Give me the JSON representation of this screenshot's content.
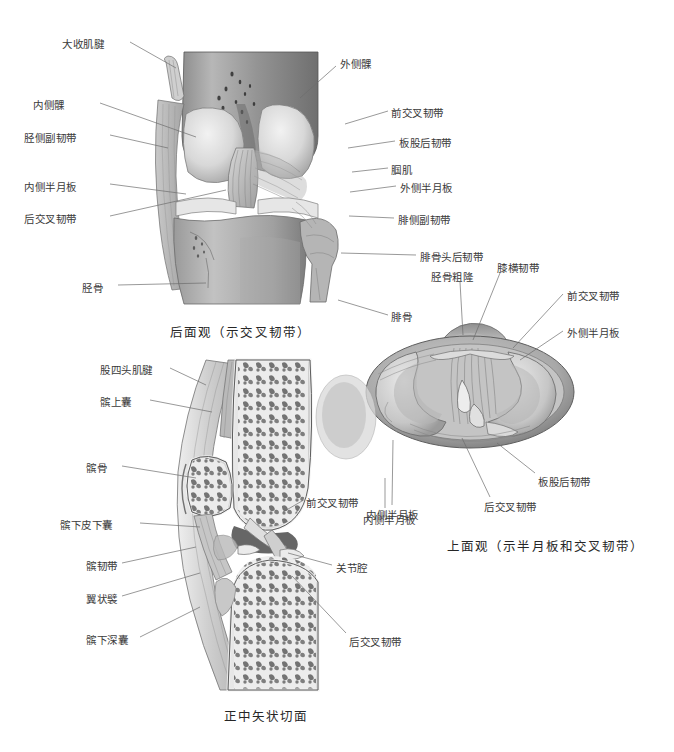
{
  "page": {
    "background": "#ffffff",
    "width": 674,
    "height": 752,
    "ink": "#3a3a3a"
  },
  "figures": [
    {
      "id": "posterior-view",
      "caption": "后面观（示交叉韧带）",
      "caption_pos": [
        170,
        322
      ],
      "labels_left": [
        {
          "text": "大收肌腱",
          "x": 62,
          "y": 38,
          "lx1": 130,
          "ly1": 42,
          "lx2": 176,
          "ly2": 68
        },
        {
          "text": "内侧髁",
          "x": 33,
          "y": 99,
          "lx1": 100,
          "ly1": 103,
          "lx2": 196,
          "ly2": 137
        },
        {
          "text": "胫侧副韧带",
          "x": 24,
          "y": 132,
          "lx1": 110,
          "ly1": 135,
          "lx2": 168,
          "ly2": 148
        },
        {
          "text": "内侧半月板",
          "x": 24,
          "y": 181,
          "lx1": 110,
          "ly1": 184,
          "lx2": 186,
          "ly2": 194
        },
        {
          "text": "后交叉韧带",
          "x": 24,
          "y": 213,
          "lx1": 110,
          "ly1": 216,
          "lx2": 226,
          "ly2": 190
        },
        {
          "text": "胫骨",
          "x": 82,
          "y": 282,
          "lx1": 118,
          "ly1": 285,
          "lx2": 206,
          "ly2": 283
        }
      ],
      "labels_right": [
        {
          "text": "外侧髁",
          "x": 340,
          "y": 58,
          "lx1": 336,
          "ly1": 66,
          "lx2": 300,
          "ly2": 98
        },
        {
          "text": "前交叉韧带",
          "x": 391,
          "y": 107,
          "lx1": 388,
          "ly1": 111,
          "lx2": 345,
          "ly2": 124
        },
        {
          "text": "板股后韧带",
          "x": 399,
          "y": 137,
          "lx1": 395,
          "ly1": 141,
          "lx2": 348,
          "ly2": 148
        },
        {
          "text": "腘肌",
          "x": 391,
          "y": 164,
          "lx1": 388,
          "ly1": 168,
          "lx2": 352,
          "ly2": 172
        },
        {
          "text": "外侧半月板",
          "x": 400,
          "y": 182,
          "lx1": 396,
          "ly1": 186,
          "lx2": 350,
          "ly2": 192
        },
        {
          "text": "腓侧副韧带",
          "x": 398,
          "y": 214,
          "lx1": 394,
          "ly1": 218,
          "lx2": 349,
          "ly2": 216
        },
        {
          "text": "腓骨头后韧带",
          "x": 420,
          "y": 251,
          "lx1": 416,
          "ly1": 255,
          "lx2": 341,
          "ly2": 253
        },
        {
          "text": "腓骨",
          "x": 391,
          "y": 311,
          "lx1": 388,
          "ly1": 315,
          "lx2": 338,
          "ly2": 300
        }
      ]
    },
    {
      "id": "superior-view",
      "caption": "上面观（示半月板和交叉韧带）",
      "caption_pos": [
        447,
        536
      ],
      "labels_top": [
        {
          "text": "胫骨粗隆",
          "x": 431,
          "y": 271,
          "lx1": 460,
          "ly1": 282,
          "lx2": 463,
          "ly2": 335
        },
        {
          "text": "膝横韧带",
          "x": 497,
          "y": 262,
          "lx1": 500,
          "ly1": 273,
          "lx2": 473,
          "ly2": 340
        }
      ],
      "labels_right": [
        {
          "text": "前交叉韧带",
          "x": 567,
          "y": 290,
          "lx1": 563,
          "ly1": 294,
          "lx2": 513,
          "ly2": 348
        },
        {
          "text": "外侧半月板",
          "x": 567,
          "y": 327,
          "lx1": 563,
          "ly1": 331,
          "lx2": 520,
          "ly2": 360
        },
        {
          "text": "板股后韧带",
          "x": 538,
          "y": 476,
          "lx1": 535,
          "ly1": 473,
          "lx2": 497,
          "ly2": 443
        },
        {
          "text": "后交叉韧带",
          "x": 484,
          "y": 501,
          "lx1": 490,
          "ly1": 497,
          "lx2": 462,
          "ly2": 438
        }
      ],
      "labels_left": [
        {
          "text": "内侧半月板",
          "x": 366,
          "y": 509,
          "lx1": 392,
          "ly1": 505,
          "lx2": 393,
          "ly2": 440
        }
      ]
    },
    {
      "id": "sagittal-view",
      "caption": "正中矢状切面",
      "caption_pos": [
        224,
        706
      ],
      "labels_left": [
        {
          "text": "股四头肌腱",
          "x": 100,
          "y": 364,
          "lx1": 170,
          "ly1": 368,
          "lx2": 206,
          "ly2": 385
        },
        {
          "text": "髌上囊",
          "x": 100,
          "y": 396,
          "lx1": 150,
          "ly1": 400,
          "lx2": 212,
          "ly2": 412
        },
        {
          "text": "髌骨",
          "x": 86,
          "y": 462,
          "lx1": 122,
          "ly1": 466,
          "lx2": 196,
          "ly2": 478
        },
        {
          "text": "髌下皮下囊",
          "x": 60,
          "y": 519,
          "lx1": 140,
          "ly1": 523,
          "lx2": 200,
          "ly2": 527
        },
        {
          "text": "髌韧带",
          "x": 86,
          "y": 560,
          "lx1": 122,
          "ly1": 563,
          "lx2": 196,
          "ly2": 547
        },
        {
          "text": "翼状襞",
          "x": 86,
          "y": 593,
          "lx1": 122,
          "ly1": 596,
          "lx2": 200,
          "ly2": 573
        },
        {
          "text": "髌下深囊",
          "x": 86,
          "y": 634,
          "lx1": 140,
          "ly1": 637,
          "lx2": 200,
          "ly2": 607
        }
      ],
      "labels_right": [
        {
          "text": "前交叉韧带",
          "x": 306,
          "y": 497,
          "lx1": 302,
          "ly1": 501,
          "lx2": 283,
          "ly2": 512
        },
        {
          "text": "内侧半月板",
          "x": 363,
          "y": 514,
          "lx1": 385,
          "ly1": 508,
          "lx2": 385,
          "ly2": 478
        },
        {
          "text": "关节腔",
          "x": 336,
          "y": 562,
          "lx1": 332,
          "ly1": 565,
          "lx2": 288,
          "ly2": 553
        },
        {
          "text": "后交叉韧带",
          "x": 349,
          "y": 636,
          "lx1": 346,
          "ly1": 633,
          "lx2": 292,
          "ly2": 576
        }
      ]
    }
  ]
}
